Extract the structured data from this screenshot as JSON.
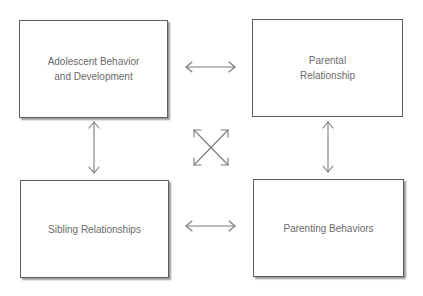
{
  "diagram": {
    "type": "conceptual-framework",
    "nodes": [
      {
        "id": "adolescent",
        "label": "Adolescent Behavior\nand Development",
        "position": "top-left"
      },
      {
        "id": "parental",
        "label": "Parental\nRelationship",
        "position": "top-right"
      },
      {
        "id": "sibling",
        "label": "Sibling Relationships",
        "position": "bottom-left"
      },
      {
        "id": "parenting",
        "label": "Parenting Behaviors",
        "position": "bottom-right"
      }
    ],
    "edges": [
      {
        "from": "adolescent",
        "to": "parental",
        "style": "bidirectional"
      },
      {
        "from": "adolescent",
        "to": "sibling",
        "style": "bidirectional"
      },
      {
        "from": "parental",
        "to": "parenting",
        "style": "bidirectional"
      },
      {
        "from": "sibling",
        "to": "parenting",
        "style": "bidirectional"
      },
      {
        "from": "adolescent",
        "to": "parenting",
        "style": "bidirectional"
      },
      {
        "from": "parental",
        "to": "sibling",
        "style": "bidirectional"
      }
    ],
    "colors": {
      "border": "#5e5e5e",
      "text": "#6a6a6a",
      "arrow": "#7a7a7a",
      "shadow": "#9a9a9a"
    }
  }
}
